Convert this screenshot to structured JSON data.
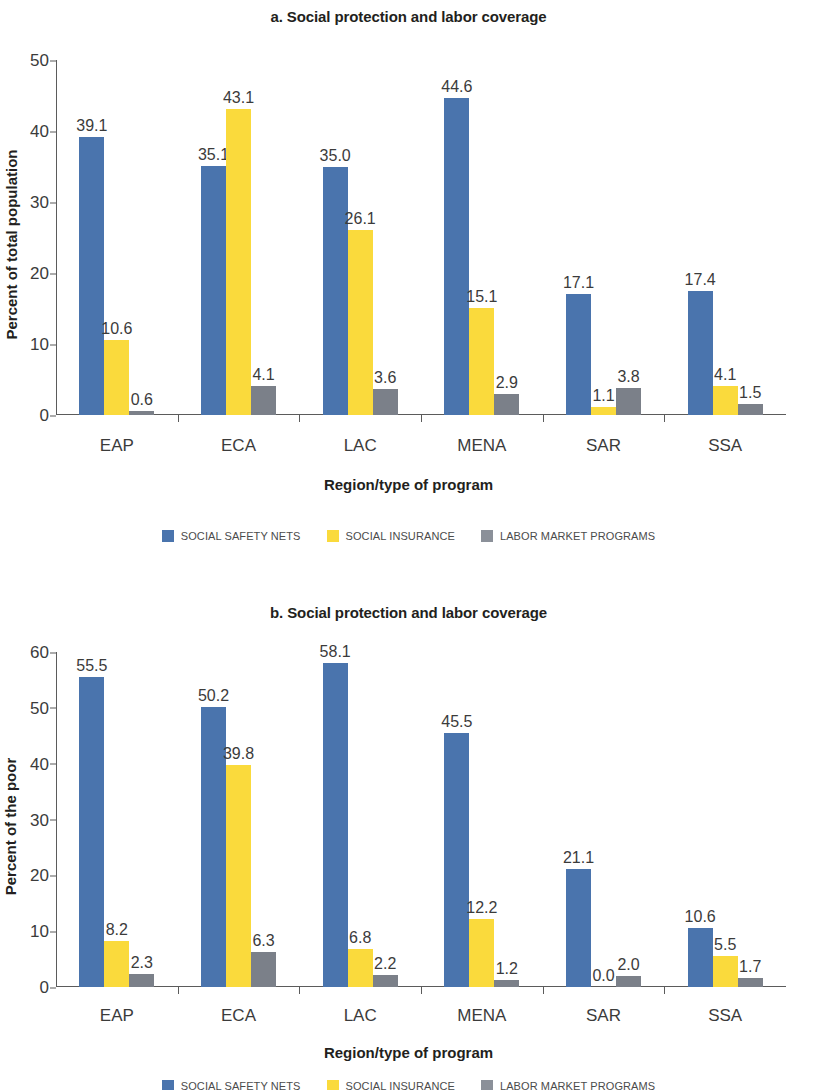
{
  "chart_data": [
    {
      "type": "bar",
      "panel_id": "a",
      "title": "a. Social protection and labor coverage",
      "xlabel": "Region/type of program",
      "ylabel": "Percent of total population",
      "categories": [
        "EAP",
        "ECA",
        "LAC",
        "MENA",
        "SAR",
        "SSA"
      ],
      "ylim": [
        0,
        50
      ],
      "yticks": [
        0,
        10,
        20,
        30,
        40,
        50
      ],
      "ytick_labels": [
        "0",
        "10",
        "20",
        "30",
        "40",
        "50"
      ],
      "grid": false,
      "legend_position": "bottom",
      "series": [
        {
          "name": "SOCIAL SAFETY NETS",
          "color": "#4a74ad",
          "values": [
            39.1,
            35.1,
            35.0,
            44.6,
            17.1,
            17.4
          ],
          "labels": [
            "39.1",
            "35.1",
            "35.0",
            "44.6",
            "17.1",
            "17.4"
          ]
        },
        {
          "name": "SOCIAL INSURANCE",
          "color": "#fada3c",
          "values": [
            10.6,
            43.1,
            26.1,
            15.1,
            1.1,
            4.1
          ],
          "labels": [
            "10.6",
            "43.1",
            "26.1",
            "15.1",
            "1.1",
            "4.1"
          ]
        },
        {
          "name": "LABOR MARKET PROGRAMS",
          "color": "#7b8089",
          "values": [
            0.6,
            4.1,
            3.6,
            2.9,
            3.8,
            1.5
          ],
          "labels": [
            "0.6",
            "4.1",
            "3.6",
            "2.9",
            "3.8",
            "1.5"
          ]
        }
      ]
    },
    {
      "type": "bar",
      "panel_id": "b",
      "title": "b. Social protection and labor coverage",
      "xlabel": "Region/type of program",
      "ylabel": "Percent of the poor",
      "categories": [
        "EAP",
        "ECA",
        "LAC",
        "MENA",
        "SAR",
        "SSA"
      ],
      "ylim": [
        0,
        60
      ],
      "yticks": [
        0,
        10,
        20,
        30,
        40,
        50,
        60
      ],
      "ytick_labels": [
        "0",
        "10",
        "20",
        "30",
        "40",
        "50",
        "60"
      ],
      "grid": false,
      "legend_position": "bottom",
      "series": [
        {
          "name": "SOCIAL SAFETY NETS",
          "color": "#4a74ad",
          "values": [
            55.5,
            50.2,
            58.1,
            45.5,
            21.1,
            10.6
          ],
          "labels": [
            "55.5",
            "50.2",
            "58.1",
            "45.5",
            "21.1",
            "10.6"
          ]
        },
        {
          "name": "SOCIAL INSURANCE",
          "color": "#fada3c",
          "values": [
            8.2,
            39.8,
            6.8,
            12.2,
            0.0,
            5.5
          ],
          "labels": [
            "8.2",
            "39.8",
            "6.8",
            "12.2",
            "0.0",
            "5.5"
          ]
        },
        {
          "name": "LABOR MARKET PROGRAMS",
          "color": "#7b8089",
          "values": [
            2.3,
            6.3,
            2.2,
            1.2,
            2.0,
            1.7
          ],
          "labels": [
            "2.3",
            "6.3",
            "2.2",
            "1.2",
            "2.0",
            "1.7"
          ]
        }
      ]
    }
  ]
}
